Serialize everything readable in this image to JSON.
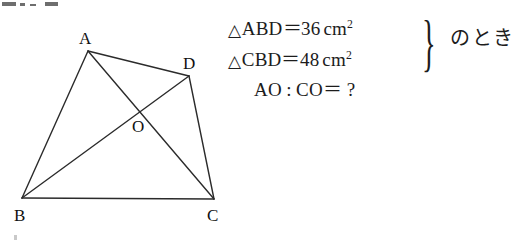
{
  "figure": {
    "name": "quadrilateral-abcd-with-diagonals",
    "vertices": [
      {
        "id": "A",
        "label": "A",
        "x": 88,
        "y": 51,
        "label_x": 79,
        "label_y": 30
      },
      {
        "id": "D",
        "label": "D",
        "x": 189,
        "y": 76,
        "label_x": 183,
        "label_y": 55
      },
      {
        "id": "C",
        "label": "C",
        "x": 214,
        "y": 199,
        "label_x": 207,
        "label_y": 207
      },
      {
        "id": "B",
        "label": "B",
        "x": 22,
        "y": 198,
        "label_x": 14,
        "label_y": 207
      },
      {
        "id": "O",
        "label": "O",
        "x": 140,
        "y": 109,
        "label_x": 132,
        "label_y": 118
      }
    ],
    "edges": [
      {
        "name": "side-ab",
        "from": "A",
        "to": "B"
      },
      {
        "name": "side-ad",
        "from": "A",
        "to": "D"
      },
      {
        "name": "side-dc",
        "from": "D",
        "to": "C"
      },
      {
        "name": "side-bc",
        "from": "B",
        "to": "C"
      },
      {
        "name": "diagonal-ac",
        "from": "A",
        "to": "C"
      },
      {
        "name": "diagonal-bd",
        "from": "B",
        "to": "D"
      }
    ],
    "stroke_color": "#2b2b2b",
    "stroke_width": 1.4
  },
  "statement": {
    "equations": [
      {
        "triangle_symbol": "△",
        "triangle_name": "ABD",
        "equals": "＝",
        "value": "36",
        "unit": "cm",
        "unit_exponent": "2"
      },
      {
        "triangle_symbol": "△",
        "triangle_name": "CBD",
        "equals": "＝",
        "value": "48",
        "unit": "cm",
        "unit_exponent": "2"
      }
    ],
    "brace": "}",
    "condition": "のとき",
    "question": {
      "left_term": "AO",
      "colon": ":",
      "right_term": "CO",
      "equals": "＝",
      "answer": "?"
    }
  }
}
